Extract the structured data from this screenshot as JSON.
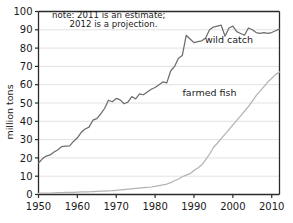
{
  "chart_data": {
    "type": "line",
    "title": "",
    "xlabel": "",
    "ylabel": "million tons",
    "xlim": [
      1950,
      2012
    ],
    "ylim": [
      0,
      100
    ],
    "grid": true,
    "legend_position": "inline-annotation",
    "xticks": [
      1950,
      1960,
      1970,
      1980,
      1990,
      2000,
      2010
    ],
    "xtick_labels": [
      "1950",
      "1960",
      "1970",
      "1980",
      "1990",
      "2000",
      "2010"
    ],
    "yticks": [
      0,
      10,
      20,
      30,
      40,
      50,
      60,
      70,
      80,
      90,
      100
    ],
    "ytick_labels": [
      "0",
      "10",
      "20",
      "30",
      "40",
      "50",
      "60",
      "70",
      "80",
      "90",
      "100"
    ],
    "annotations": [
      {
        "name": "note-line-1",
        "text": "note: 2011 is an estimate;",
        "x": 1953.5,
        "y": 96.5
      },
      {
        "name": "note-line-2",
        "text": "2012 is a projection.",
        "x": 1958.0,
        "y": 91.5
      }
    ],
    "x": [
      1950,
      1951,
      1952,
      1953,
      1954,
      1955,
      1956,
      1957,
      1958,
      1959,
      1960,
      1961,
      1962,
      1963,
      1964,
      1965,
      1966,
      1967,
      1968,
      1969,
      1970,
      1971,
      1972,
      1973,
      1974,
      1975,
      1976,
      1977,
      1978,
      1979,
      1980,
      1981,
      1982,
      1983,
      1984,
      1985,
      1986,
      1987,
      1988,
      1989,
      1990,
      1991,
      1992,
      1993,
      1994,
      1995,
      1996,
      1997,
      1998,
      1999,
      2000,
      2001,
      2002,
      2003,
      2004,
      2005,
      2006,
      2007,
      2008,
      2009,
      2010,
      2011,
      2012
    ],
    "series": [
      {
        "name": "wild catch",
        "color": "#6d6d6d",
        "label_x": 1999,
        "label_y": 83,
        "values": [
          17.2,
          19.5,
          21.0,
          21.6,
          23.2,
          24.5,
          26.2,
          26.4,
          26.6,
          29.0,
          31.0,
          34.0,
          35.8,
          36.8,
          40.6,
          41.5,
          44.0,
          47.0,
          51.5,
          50.7,
          52.5,
          51.7,
          49.6,
          50.5,
          53.5,
          52.2,
          55.0,
          54.5,
          56.0,
          57.5,
          58.5,
          60.0,
          61.5,
          61.0,
          67.5,
          70.0,
          74.5,
          76.0,
          87.0,
          85.0,
          83.0,
          83.5,
          84.0,
          85.5,
          90.0,
          91.5,
          92.0,
          92.5,
          86.5,
          91.0,
          92.0,
          89.0,
          88.0,
          87.0,
          91.0,
          90.0,
          88.5,
          88.0,
          88.5,
          88.0,
          88.5,
          89.5,
          90.5
        ]
      },
      {
        "name": "farmed fish",
        "color": "#b3b3b3",
        "label_x": 1994,
        "label_y": 54,
        "values": [
          0.6,
          0.7,
          0.8,
          0.8,
          0.9,
          1.0,
          1.0,
          1.1,
          1.1,
          1.2,
          1.3,
          1.4,
          1.5,
          1.5,
          1.6,
          1.7,
          1.8,
          1.9,
          2.0,
          2.1,
          2.3,
          2.5,
          2.7,
          2.9,
          3.1,
          3.3,
          3.5,
          3.7,
          3.9,
          4.1,
          4.4,
          4.8,
          5.2,
          5.7,
          6.5,
          7.5,
          8.5,
          9.7,
          10.6,
          11.4,
          13.1,
          14.5,
          16.2,
          19.0,
          22.0,
          25.7,
          28.0,
          30.5,
          33.0,
          35.5,
          38.0,
          40.5,
          43.0,
          45.5,
          48.0,
          51.0,
          54.0,
          56.5,
          59.0,
          61.5,
          63.5,
          65.5,
          67.0
        ]
      }
    ]
  },
  "style": {
    "plot_border_color": "#2b2b2b",
    "grid_color": "#e2e2e2",
    "background": "#ffffff",
    "tick_color": "#2b2b2b"
  }
}
